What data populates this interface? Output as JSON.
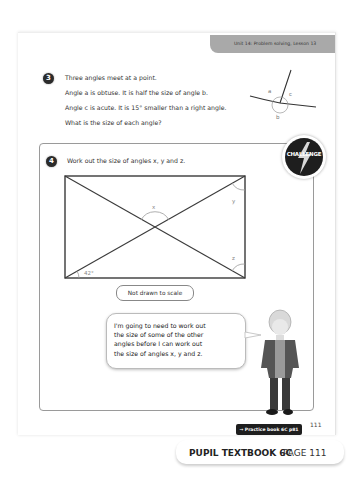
{
  "header": {
    "unit_label": "Unit 14: Problem solving, Lesson 13"
  },
  "question3": {
    "number": "3",
    "lines": [
      "Three angles meet at a point.",
      "Angle a is obtuse. It is half the size of angle b.",
      "Angle c is acute. It is 15° smaller than a right angle.",
      "What is the size of each angle?"
    ],
    "diagram_labels": {
      "a": "a",
      "b": "b",
      "c": "c"
    }
  },
  "question4": {
    "number": "4",
    "prompt": "Work out the size of angles x, y and z.",
    "challenge_badge": "CHALLENGE",
    "diagram": {
      "shape": "rectangle with both diagonals",
      "labels": {
        "x": "x",
        "y": "y",
        "z": "z",
        "given": "42°"
      }
    },
    "scale_note": "Not drawn to scale",
    "speech_bubble": [
      "I'm going to need to work out",
      "the size of some of the other",
      "angles before I can work out",
      "the size of angles x, y and z."
    ]
  },
  "footer": {
    "practice_link": "→ Practice book 6C p81",
    "page_number": "111",
    "book_title": "PUPIL TEXTBOOK 6C",
    "page_label": "PAGE 111"
  },
  "colors": {
    "header_tab": "#a9a9a9",
    "badge_dark": "#1e1e1e",
    "line": "#3a3a3a",
    "arc": "#9a9a9a"
  }
}
